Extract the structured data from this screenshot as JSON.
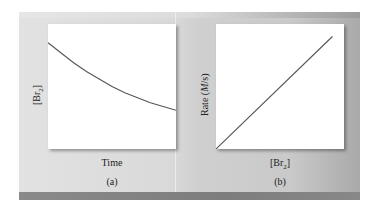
{
  "chart_data": [
    {
      "type": "line",
      "panel": "(a)",
      "title": "",
      "xlabel": "Time",
      "ylabel": "[Br2]",
      "description": "Exponential decay of [Br2] over time",
      "x": [
        0,
        0.1,
        0.2,
        0.3,
        0.4,
        0.5,
        0.6,
        0.7,
        0.8,
        0.9,
        1.0
      ],
      "values": [
        0.85,
        0.77,
        0.69,
        0.62,
        0.56,
        0.5,
        0.45,
        0.41,
        0.37,
        0.34,
        0.31
      ],
      "ylim": [
        0,
        1
      ],
      "xlim": [
        0,
        1
      ],
      "grid": false,
      "ticks": false
    },
    {
      "type": "line",
      "panel": "(b)",
      "title": "",
      "xlabel": "[Br2]",
      "ylabel": "Rate (M/s)",
      "description": "Rate directly proportional to [Br2]",
      "x": [
        0,
        1.0
      ],
      "values": [
        0,
        0.9
      ],
      "ylim": [
        0,
        1
      ],
      "xlim": [
        0,
        1.1
      ],
      "grid": false,
      "ticks": false
    }
  ],
  "labels": {
    "a": {
      "ylabel_main": "[Br",
      "ylabel_sub": "2",
      "ylabel_end": "]",
      "xlabel": "Time",
      "caption": "(a)"
    },
    "b": {
      "ylabel_pre": "Rate (",
      "ylabel_italic": "M",
      "ylabel_post": "/s)",
      "xlabel_main": "[Br",
      "xlabel_sub": "2",
      "xlabel_end": "]",
      "caption": "(b)"
    }
  },
  "colors": {
    "curve": "#555555",
    "plot_bg": "#ffffff",
    "panel_bg": "#d6d6d6",
    "bottom_bar": "#848484"
  }
}
